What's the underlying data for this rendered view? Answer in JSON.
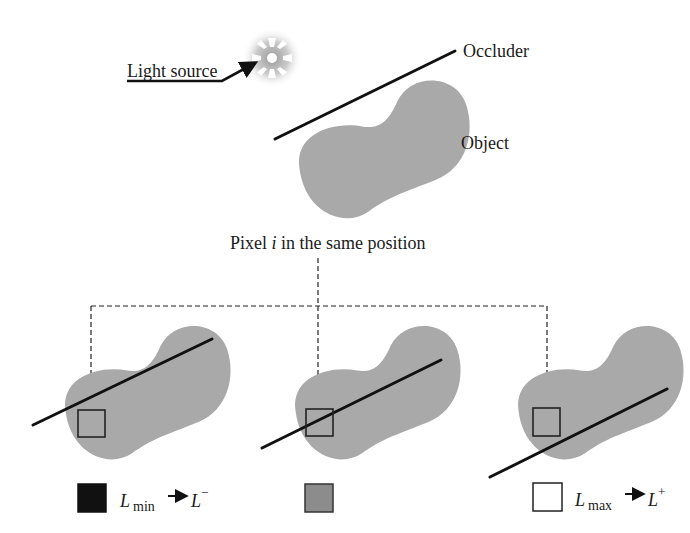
{
  "labels": {
    "light_source": "Light source",
    "occluder": "Occluder",
    "object": "Object",
    "pixel_caption_prefix": "Pixel ",
    "pixel_caption_var": "i",
    "pixel_caption_suffix": " in the same position"
  },
  "legend": [
    {
      "swatch_color": "#111111",
      "symbol": "L",
      "subscript": "min",
      "arrow": "→",
      "target_symbol": "L",
      "target_superscript": "−"
    },
    {
      "swatch_color": "#8c8c8c"
    },
    {
      "swatch_color": "#ffffff",
      "symbol": "L",
      "subscript": "max",
      "arrow": "→",
      "target_symbol": "L",
      "target_superscript": "+"
    }
  ],
  "colors": {
    "object_fill": "#a9a9a9",
    "occluder_stroke": "#111111",
    "background": "#ffffff"
  },
  "panels": [
    {
      "case": "pixel fully shadowed by occluder"
    },
    {
      "case": "occluder crossing pixel (penumbra)"
    },
    {
      "case": "pixel fully lit, occluder below"
    }
  ]
}
